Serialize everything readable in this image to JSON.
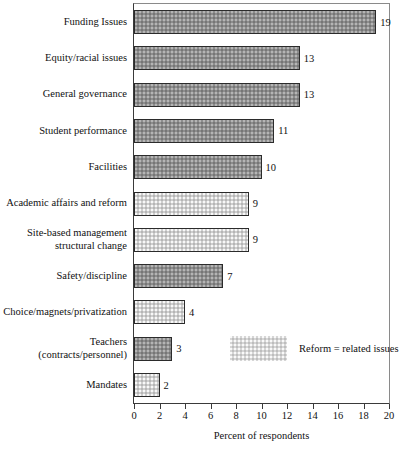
{
  "chart_data": {
    "type": "bar",
    "orientation": "horizontal",
    "title": "",
    "xlabel": "Percent of respondents",
    "ylabel": "",
    "xlim": [
      0,
      20
    ],
    "xticks": [
      0,
      2,
      4,
      6,
      8,
      10,
      12,
      14,
      16,
      18,
      20
    ],
    "grid": false,
    "categories": [
      "Funding Issues",
      "Equity/racial issues",
      "General governance",
      "Student performance",
      "Facilities",
      "Academic affairs and reform",
      "Site-based management\nstructural change",
      "Safety/discipline",
      "Choice/magnets/privatization",
      "Teachers\n(contracts/personnel)",
      "Mandates"
    ],
    "values": [
      19,
      13,
      13,
      11,
      10,
      9,
      9,
      7,
      4,
      3,
      2
    ],
    "value_labels": [
      "19",
      "13",
      "13",
      "11",
      "10",
      "9",
      "9",
      "7",
      "4",
      "3",
      "2"
    ],
    "bar_styles": [
      "dark",
      "dark",
      "dark",
      "dark",
      "dark",
      "light",
      "light",
      "dark",
      "light",
      "dark",
      "light"
    ],
    "legend": {
      "position": "inside-right",
      "entries": [
        {
          "label": "Reform = related issues",
          "style": "light"
        }
      ]
    },
    "colors": {
      "dark_fill": "#8d8d8d",
      "light_fill": "#cfcfcf",
      "bar_border": "#2b2b2b",
      "axis": "#3a3a3a",
      "text": "#111111",
      "background": "#ffffff"
    }
  }
}
